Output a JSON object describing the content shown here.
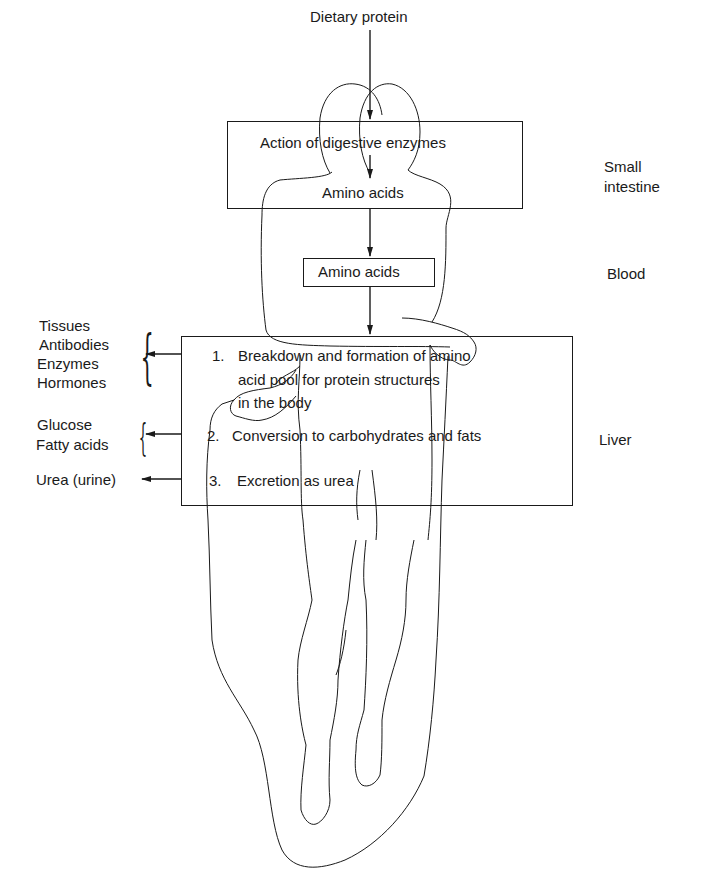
{
  "diagram": {
    "type": "flow",
    "input": {
      "label": "Dietary protein"
    },
    "small_intestine_box": {
      "line1": "Action of digestive enzymes",
      "line2": "Amino acids",
      "side_label_line1": "Small",
      "side_label_line2": "intestine"
    },
    "blood_box": {
      "label": "Amino acids",
      "side_label": "Blood"
    },
    "liver_box": {
      "side_label": "Liver",
      "items": [
        {
          "number": "1.",
          "lines": [
            "Breakdown and formation of amino",
            "acid pool for protein structures",
            "in the body"
          ]
        },
        {
          "number": "2.",
          "lines": [
            "Conversion to carbohydrates and fats"
          ]
        },
        {
          "number": "3.",
          "lines": [
            "Excretion as urea"
          ]
        }
      ]
    },
    "outputs": [
      {
        "labels": [
          "Tissues",
          "Antibodies",
          "Enzymes",
          "Hormones"
        ]
      },
      {
        "labels": [
          "Glucose",
          "Fatty acids"
        ]
      },
      {
        "labels": [
          "Urea (urine)"
        ]
      }
    ],
    "illustration": "human-body-outline",
    "colors": {
      "ink": "#1a1a1a",
      "background": "#ffffff"
    }
  }
}
